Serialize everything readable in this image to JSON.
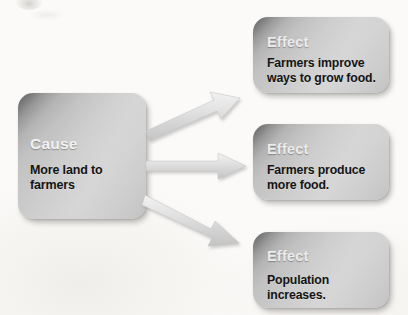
{
  "diagram": {
    "type": "cause-and-effect",
    "background_color": "#fbfaf8",
    "box_fill_light": "#cbcbcb",
    "box_fill_dark": "#5f5f5f",
    "arrow_color": "#dcdcdc",
    "label_color": "#f2f2f2",
    "body_text_color": "#141414",
    "cause": {
      "kind_label": "Cause",
      "text": "More land to farmers"
    },
    "effects": [
      {
        "kind_label": "Effect",
        "text": "Farmers improve\nways to grow food."
      },
      {
        "kind_label": "Effect",
        "text": "Farmers produce\nmore food."
      },
      {
        "kind_label": "Effect",
        "text": "Population increases."
      }
    ],
    "connectors": [
      {
        "name": "arrow-cause-to-effect-1",
        "direction": "up-right"
      },
      {
        "name": "arrow-cause-to-effect-2",
        "direction": "right"
      },
      {
        "name": "arrow-cause-to-effect-3",
        "direction": "down-right"
      }
    ]
  }
}
